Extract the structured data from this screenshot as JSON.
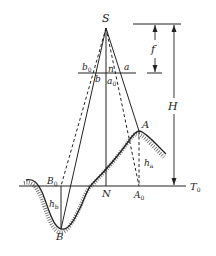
{
  "diagram": {
    "type": "photogrammetry-relief-displacement",
    "labels": {
      "S": "S",
      "f": "f",
      "H": "H",
      "b0": "b",
      "b0_sub": "0",
      "b": "b",
      "n": "n",
      "a": "a",
      "a0": "a",
      "a0_sub": "0",
      "A": "A",
      "A0": "A",
      "A0_sub": "0",
      "B": "B",
      "B0": "B",
      "B0_sub": "0",
      "N": "N",
      "T0": "T",
      "T0_sub": "0",
      "ha": "h",
      "ha_sub": "a",
      "hb": "h",
      "hb_sub": "b"
    },
    "colors": {
      "line": "#222222",
      "background": "#ffffff"
    }
  }
}
